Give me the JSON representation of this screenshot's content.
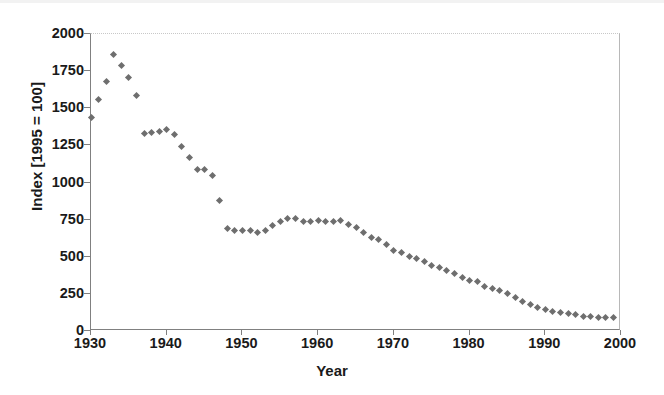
{
  "chart_data": {
    "type": "scatter",
    "title": "",
    "xlabel": "Year",
    "ylabel": "Index [1995 = 100]",
    "xlim": [
      1930,
      2000
    ],
    "ylim": [
      0,
      2000
    ],
    "xticks": [
      1930,
      1940,
      1950,
      1960,
      1970,
      1980,
      1990,
      2000
    ],
    "yticks": [
      0,
      250,
      500,
      750,
      1000,
      1250,
      1500,
      1750,
      2000
    ],
    "grid": false,
    "legend": null,
    "marker": "diamond",
    "marker_color": "#6e6e6e",
    "series": [
      {
        "name": "Index",
        "x": [
          1930,
          1931,
          1932,
          1933,
          1934,
          1935,
          1936,
          1937,
          1938,
          1939,
          1940,
          1941,
          1942,
          1943,
          1944,
          1945,
          1946,
          1947,
          1948,
          1949,
          1950,
          1951,
          1952,
          1953,
          1954,
          1955,
          1956,
          1957,
          1958,
          1959,
          1960,
          1961,
          1962,
          1963,
          1964,
          1965,
          1966,
          1967,
          1968,
          1969,
          1970,
          1971,
          1972,
          1973,
          1974,
          1975,
          1976,
          1977,
          1978,
          1979,
          1980,
          1981,
          1982,
          1983,
          1984,
          1985,
          1986,
          1987,
          1988,
          1989,
          1990,
          1991,
          1992,
          1993,
          1994,
          1995,
          1996,
          1997,
          1998,
          1999
        ],
        "y": [
          1440,
          1560,
          1680,
          1860,
          1785,
          1710,
          1585,
          1330,
          1340,
          1345,
          1355,
          1320,
          1245,
          1165,
          1085,
          1085,
          1045,
          880,
          690,
          680,
          680,
          675,
          660,
          680,
          710,
          740,
          760,
          755,
          735,
          740,
          745,
          740,
          735,
          745,
          720,
          695,
          660,
          630,
          615,
          580,
          545,
          530,
          505,
          490,
          465,
          440,
          430,
          410,
          390,
          360,
          340,
          330,
          300,
          285,
          270,
          250,
          225,
          200,
          180,
          160,
          145,
          130,
          125,
          115,
          110,
          100,
          95,
          92,
          90,
          88
        ]
      }
    ]
  },
  "axes": {
    "y_title": "Index [1995 = 100]",
    "x_title": "Year",
    "y_tick_labels": [
      "2000",
      "1750",
      "1500",
      "1250",
      "1000",
      "750",
      "500",
      "250",
      "0"
    ],
    "x_tick_labels": [
      "1930",
      "1940",
      "1950",
      "1960",
      "1970",
      "1980",
      "1990",
      "2000"
    ]
  }
}
